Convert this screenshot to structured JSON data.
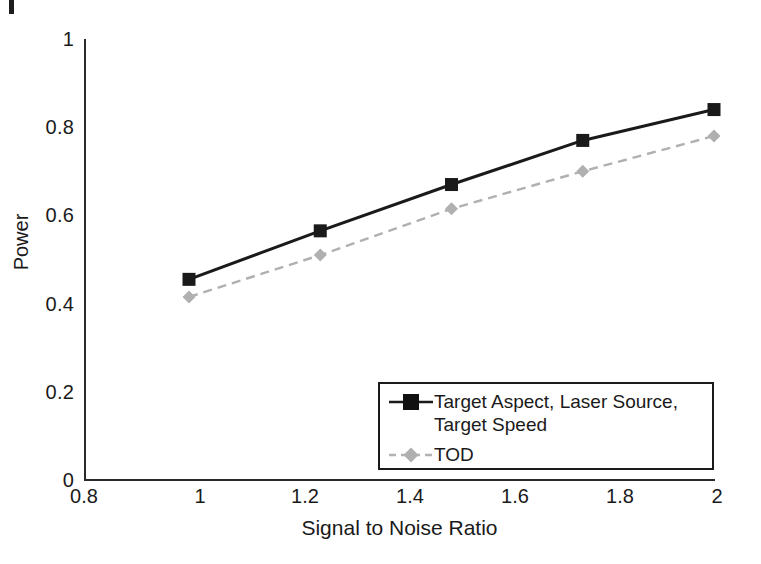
{
  "chart_data": {
    "type": "line",
    "title": "",
    "xlabel": "Signal to Noise Ratio",
    "ylabel": "Power",
    "x": [
      1,
      1.25,
      1.5,
      1.75,
      2
    ],
    "xlim": [
      0.8,
      2
    ],
    "ylim": [
      0,
      1
    ],
    "xticks": [
      "0.8",
      "1",
      "1.2",
      "1.4",
      "1.6",
      "1.8",
      "2"
    ],
    "xtick_values": [
      0.8,
      1,
      1.2,
      1.4,
      1.6,
      1.8,
      2
    ],
    "yticks": [
      "0",
      "0.2",
      "0.4",
      "0.6",
      "0.8",
      "1"
    ],
    "ytick_values": [
      0,
      0.2,
      0.4,
      0.6,
      0.8,
      1
    ],
    "grid": false,
    "legend_position": "bottom-right",
    "series": [
      {
        "name": "Target Aspect, Laser Source, Target Speed",
        "values": [
          0.455,
          0.565,
          0.67,
          0.77,
          0.84
        ],
        "color": "#1a1a1a",
        "marker": "square",
        "linestyle": "solid"
      },
      {
        "name": "TOD",
        "values": [
          0.415,
          0.51,
          0.615,
          0.7,
          0.78
        ],
        "color": "#b0b0b0",
        "marker": "diamond",
        "linestyle": "dashed"
      }
    ]
  },
  "legend": {
    "entries": [
      {
        "label": "Target Aspect, Laser Source, Target Speed"
      },
      {
        "label": "TOD"
      }
    ]
  }
}
